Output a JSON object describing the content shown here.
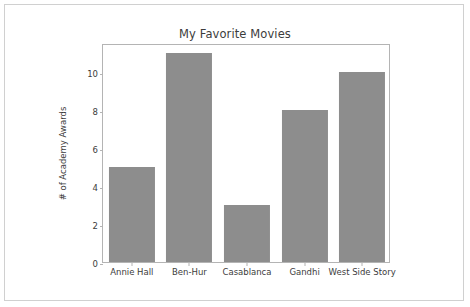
{
  "figure": {
    "background_color": "#ffffff",
    "border_color": "#d0d0d0"
  },
  "chart_data": {
    "type": "bar",
    "title": "My Favorite Movies",
    "xlabel": "",
    "ylabel": "# of Academy Awards",
    "categories": [
      "Annie Hall",
      "Ben-Hur",
      "Casablanca",
      "Gandhi",
      "West Side Story"
    ],
    "values": [
      5,
      11,
      3,
      8,
      10
    ],
    "ylim": [
      0,
      11.55
    ],
    "ytick_labels": [
      "0",
      "2",
      "4",
      "6",
      "8",
      "10"
    ],
    "ytick_values": [
      0,
      2,
      4,
      6,
      8,
      10
    ],
    "grid": false,
    "legend": null,
    "bar_color": "#8d8d8d",
    "axis_color": "#b4b4b4",
    "text_color": "#3c3c3c",
    "bar_width_fraction": 0.8
  }
}
